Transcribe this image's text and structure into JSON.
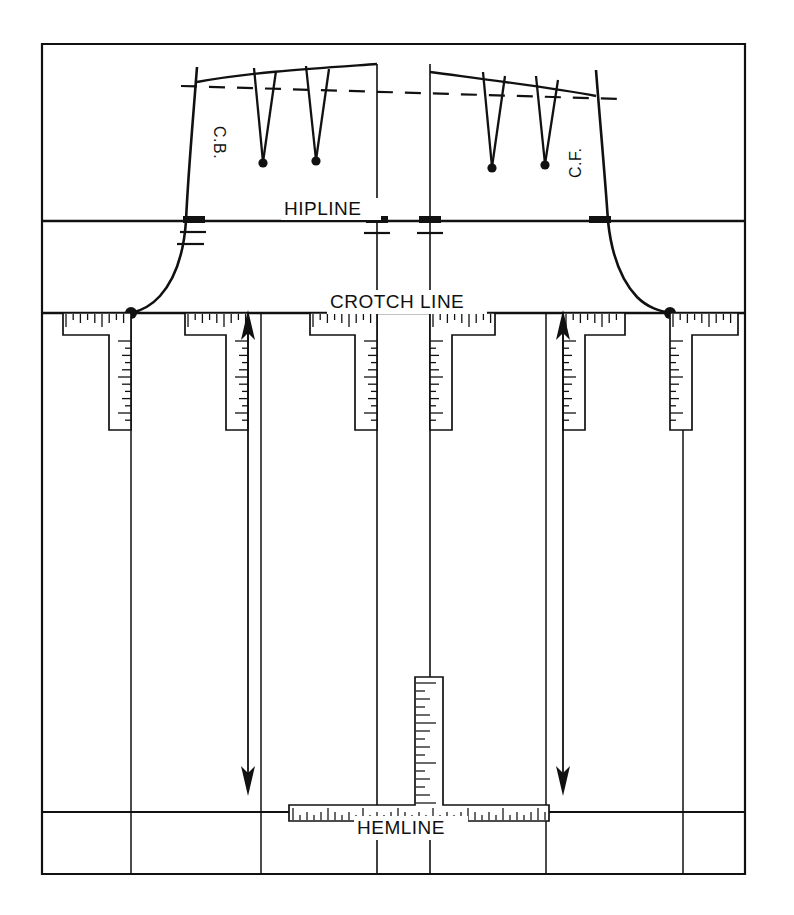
{
  "figure": {
    "type": "technical-pattern-diagram",
    "ink_color": "#111111",
    "background_color": "#ffffff",
    "canvas": {
      "width": 794,
      "height": 915
    }
  },
  "labels": {
    "hipline": "HIPLINE",
    "crotch_line": "CROTCH LINE",
    "hemline": "HEMLINE",
    "center_back": "C.B.",
    "center_front": "C.F."
  },
  "reference_lines": [
    {
      "name": "hipline",
      "orientation": "horizontal",
      "y": 221,
      "x1": 42,
      "x2": 745
    },
    {
      "name": "crotch-line",
      "orientation": "horizontal",
      "y": 313,
      "x1": 42,
      "x2": 745
    },
    {
      "name": "hemline",
      "orientation": "horizontal",
      "y": 812,
      "x1": 42,
      "x2": 745
    },
    {
      "name": "frame-top",
      "orientation": "horizontal",
      "y": 44,
      "x1": 42,
      "x2": 745
    },
    {
      "name": "frame-bottom",
      "orientation": "horizontal",
      "y": 874,
      "x1": 42,
      "x2": 745
    },
    {
      "name": "frame-left",
      "orientation": "vertical",
      "x": 42,
      "y1": 44,
      "y2": 874
    },
    {
      "name": "frame-right",
      "orientation": "vertical",
      "x": 745,
      "y1": 44,
      "y2": 874
    }
  ],
  "vertical_seams": [
    {
      "name": "back-side-seam",
      "x": 131,
      "y1": 313,
      "y2": 874
    },
    {
      "name": "back-inseam",
      "x": 261,
      "y1": 313,
      "y2": 874
    },
    {
      "name": "back-center",
      "x": 377,
      "y1": 64,
      "y2": 874
    },
    {
      "name": "front-center",
      "x": 430,
      "y1": 64,
      "y2": 874
    },
    {
      "name": "front-inseam",
      "x": 546,
      "y1": 313,
      "y2": 874
    },
    {
      "name": "front-side-seam",
      "x": 683,
      "y1": 313,
      "y2": 874
    }
  ],
  "pattern_pieces": [
    {
      "name": "back-piece",
      "label": "C.B.",
      "side_seam_top_x": 197,
      "center_x": 377,
      "waist_y": 78,
      "hip_y": 221,
      "crotch_y": 313
    },
    {
      "name": "front-piece",
      "label": "C.F.",
      "side_seam_top_x": 596,
      "center_x": 430,
      "waist_y": 78,
      "hip_y": 221,
      "crotch_y": 313
    }
  ],
  "darts": [
    {
      "name": "back-dart-1",
      "piece": "back",
      "apex_x": 263,
      "apex_y": 162,
      "top_left_x": 254,
      "top_right_x": 275,
      "top_y": 79
    },
    {
      "name": "back-dart-2",
      "piece": "back",
      "apex_x": 316,
      "apex_y": 160,
      "top_left_x": 306,
      "top_right_x": 328,
      "top_y": 78
    },
    {
      "name": "front-dart-1",
      "piece": "front",
      "apex_x": 492,
      "apex_y": 168,
      "top_left_x": 482,
      "top_right_x": 503,
      "top_y": 80
    },
    {
      "name": "front-dart-2",
      "piece": "front",
      "apex_x": 545,
      "apex_y": 165,
      "top_left_x": 535,
      "top_right_x": 556,
      "top_y": 83
    }
  ],
  "grainline_arrows": [
    {
      "name": "back-grainline-arrow",
      "x": 248,
      "y_top": 315,
      "y_bottom": 790,
      "heads": "both"
    },
    {
      "name": "front-grainline-arrow",
      "x": 563,
      "y_top": 315,
      "y_bottom": 790,
      "heads": "both"
    }
  ],
  "tape_measures": {
    "crotch_band": [
      {
        "name": "tape-crotch-1",
        "h_x1": 63,
        "h_x2": 131,
        "v_x": 131,
        "v_y2": 430,
        "corner": "right"
      },
      {
        "name": "tape-crotch-2",
        "h_x1": 185,
        "h_x2": 248,
        "v_x": 248,
        "v_y2": 430,
        "corner": "right"
      },
      {
        "name": "tape-crotch-3",
        "h_x1": 310,
        "h_x2": 377,
        "v_x": 377,
        "v_y2": 430,
        "corner": "right"
      },
      {
        "name": "tape-crotch-4",
        "h_x1": 430,
        "h_x2": 495,
        "v_x": 430,
        "v_y2": 430,
        "corner": "left"
      },
      {
        "name": "tape-crotch-5",
        "h_x1": 563,
        "h_x2": 625,
        "v_x": 563,
        "v_y2": 430,
        "corner": "left"
      },
      {
        "name": "tape-crotch-6",
        "h_x1": 670,
        "h_x2": 738,
        "v_x": 670,
        "v_y2": 430,
        "corner": "left"
      }
    ],
    "hem_band": {
      "name": "tape-hem",
      "horizontal": {
        "x1": 289,
        "x2": 549,
        "y": 805
      },
      "vertical": {
        "x": 415,
        "y_top": 677,
        "y_bottom": 805,
        "width": 28
      }
    }
  },
  "notches": [
    {
      "name": "hip-notch-back-side",
      "x": 197,
      "y": 221
    },
    {
      "name": "hip-notch-back-center",
      "x": 377,
      "y": 221
    },
    {
      "name": "hip-notch-front-center",
      "x": 430,
      "y": 221
    },
    {
      "name": "hip-notch-front-side",
      "x": 596,
      "y": 221
    }
  ],
  "crotch_points": [
    {
      "name": "back-crotch-point",
      "x": 131,
      "y": 313
    },
    {
      "name": "front-crotch-point",
      "x": 670,
      "y": 313
    }
  ],
  "waist_dashed_line": {
    "name": "waist-reference-dashed",
    "x1": 181,
    "x2": 620,
    "y1": 86,
    "y2": 98
  }
}
